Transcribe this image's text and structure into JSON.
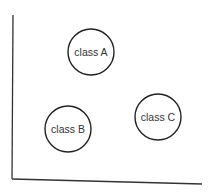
{
  "diagram": {
    "axes": {
      "y_axis": {
        "x1": 13,
        "y1": 15,
        "x2": 12,
        "y2": 179
      },
      "x_axis": {
        "x1": 12,
        "y1": 179,
        "x2": 202,
        "y2": 184
      },
      "color": "#333333"
    },
    "clusters": [
      {
        "label": "class A",
        "cx": 91,
        "cy": 52,
        "r": 23
      },
      {
        "label": "class B",
        "cx": 68,
        "cy": 129,
        "r": 23
      },
      {
        "label": "class C",
        "cx": 158,
        "cy": 117,
        "r": 23
      }
    ]
  }
}
